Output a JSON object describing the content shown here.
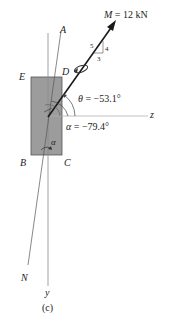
{
  "figure": {
    "caption": "(c)",
    "moment": {
      "symbol": "M",
      "equals": "= 12 kN",
      "slope": {
        "hyp": "5",
        "rise": "4",
        "run": "3"
      }
    },
    "angles": {
      "theta": {
        "symbol": "θ",
        "value": "= −53.1°"
      },
      "alpha": {
        "symbol": "α",
        "value": "= −79.4°"
      },
      "alpha_inner": "α"
    },
    "points": {
      "A": "A",
      "D": "D",
      "E": "E",
      "B": "B",
      "C": "C",
      "N": "N"
    },
    "axes": {
      "y": "y",
      "z": "z"
    },
    "colors": {
      "section_fill": "#9c9c9c",
      "section_stroke": "#555555",
      "line": "#444444",
      "axis": "#9a9a9a",
      "vector": "#1a1a1a"
    }
  }
}
